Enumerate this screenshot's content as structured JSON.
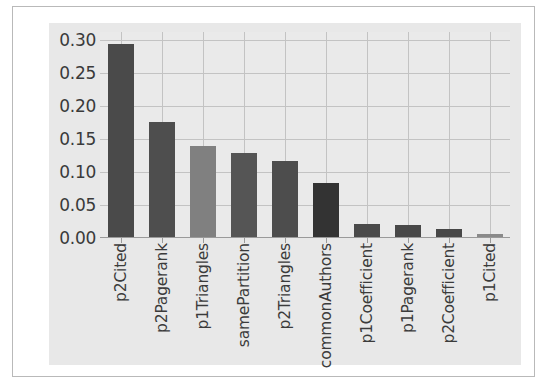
{
  "figure": {
    "background_color": "#ffffff",
    "panel_color": "#e8e8e8",
    "plot_color": "#eaeaea",
    "grid_color": "#c3c3c3",
    "frame_color": "#b9b9b9"
  },
  "chart_data": {
    "type": "bar",
    "title": "",
    "xlabel": "",
    "ylabel": "",
    "ylim": [
      0.0,
      0.3125
    ],
    "yticks": [
      0.0,
      0.05,
      0.1,
      0.15,
      0.2,
      0.25,
      0.3
    ],
    "ytick_labels": [
      "0.00",
      "0.05",
      "0.10",
      "0.15",
      "0.20",
      "0.25",
      "0.30"
    ],
    "grid": true,
    "legend": "none",
    "categories": [
      "p2Cited",
      "p2Pagerank",
      "p1Triangles",
      "samePartition",
      "p2Triangles",
      "commonAuthors",
      "p1Coefficient",
      "p1Pagerank",
      "p2Coefficient",
      "p1Cited"
    ],
    "values": [
      0.295,
      0.176,
      0.139,
      0.129,
      0.117,
      0.084,
      0.021,
      0.02,
      0.014,
      0.006
    ],
    "bar_colors": [
      "#4a4a4a",
      "#4e4e4e",
      "#808080",
      "#555555",
      "#4d4d4d",
      "#333333",
      "#4a4a4a",
      "#484848",
      "#474747",
      "#8a8a8a"
    ]
  }
}
